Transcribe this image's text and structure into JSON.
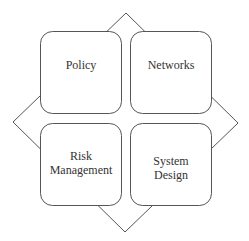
{
  "diagram": {
    "type": "quadrant-diamond",
    "stroke_color": "#555555",
    "background": "#ffffff",
    "quadrants": [
      {
        "id": "top-left",
        "label": "Policy"
      },
      {
        "id": "top-right",
        "label": "Networks"
      },
      {
        "id": "bottom-left",
        "label": "Risk\nManagement"
      },
      {
        "id": "bottom-right",
        "label": "System\nDesign"
      }
    ]
  }
}
